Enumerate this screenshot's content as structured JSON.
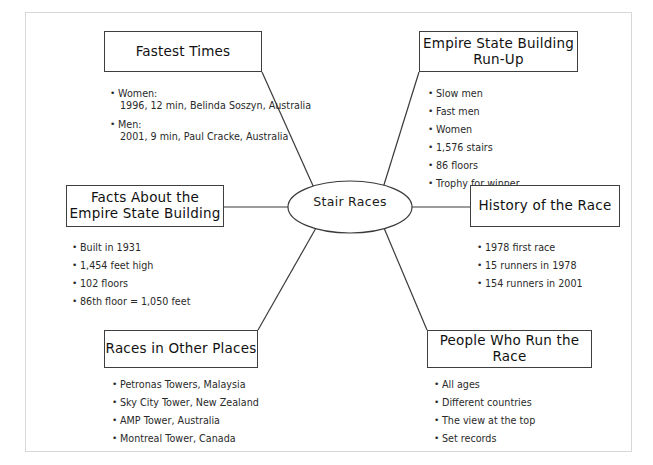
{
  "diagram": {
    "type": "mind-map",
    "center": {
      "label": "Stair Races"
    },
    "nodes": [
      {
        "id": "fastest-times",
        "title": "Fastest Times",
        "items": [
          {
            "text": "Women:",
            "sub": "1996, 12 min, Belinda Soszyn, Australia"
          },
          {
            "text": "Men:",
            "sub": "2001, 9 min, Paul Cracke, Australia"
          }
        ]
      },
      {
        "id": "empire-state-building-run-up",
        "title": "Empire State Building Run-Up",
        "title_line1": "Empire State Building",
        "title_line2": "Run-Up",
        "items": [
          {
            "text": "Slow men"
          },
          {
            "text": "Fast men"
          },
          {
            "text": "Women"
          },
          {
            "text": "1,576 stairs"
          },
          {
            "text": "86 floors"
          },
          {
            "text": "Trophy for winner"
          }
        ]
      },
      {
        "id": "facts-about-the-empire-state-building",
        "title": "Facts About the Empire State Building",
        "title_line1": "Facts About the",
        "title_line2": "Empire State Building",
        "items": [
          {
            "text": "Built in 1931"
          },
          {
            "text": "1,454 feet high"
          },
          {
            "text": "102 floors"
          },
          {
            "text": "86th floor = 1,050 feet"
          }
        ]
      },
      {
        "id": "history-of-the-race",
        "title": "History of the Race",
        "items": [
          {
            "text": "1978 first race"
          },
          {
            "text": "15 runners in 1978"
          },
          {
            "text": "154 runners in 2001"
          }
        ]
      },
      {
        "id": "races-in-other-places",
        "title": "Races in Other Places",
        "items": [
          {
            "text": "Petronas Towers, Malaysia"
          },
          {
            "text": "Sky City Tower, New Zealand"
          },
          {
            "text": "AMP Tower, Australia"
          },
          {
            "text": "Montreal Tower, Canada"
          }
        ]
      },
      {
        "id": "people-who-run-the-race",
        "title": "People Who Run the Race",
        "items": [
          {
            "text": "All ages"
          },
          {
            "text": "Different countries"
          },
          {
            "text": "The view at the top"
          },
          {
            "text": "Set records"
          }
        ]
      }
    ],
    "colors": {
      "box_border": "#3f3f3f",
      "connector": "#3a3a3a",
      "page_border": "#d8d8d8",
      "text": "#111111",
      "background": "#ffffff"
    }
  }
}
